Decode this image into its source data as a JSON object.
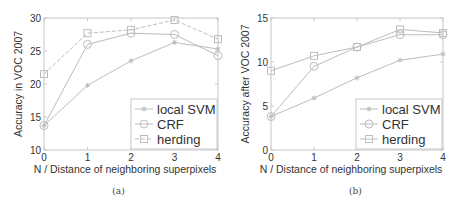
{
  "chart_data": [
    {
      "type": "line",
      "panel": "(a)",
      "title": "",
      "xlabel": "N / Distance of neighboring superpixels",
      "ylabel": "Accuracy in VOC 2007",
      "x": [
        0,
        1,
        2,
        3,
        4
      ],
      "xticks": [
        "0",
        "1",
        "2",
        "3",
        "4"
      ],
      "yticks": [
        "10",
        "15",
        "20",
        "25",
        "30"
      ],
      "xlim": [
        0,
        4
      ],
      "ylim": [
        10,
        30
      ],
      "grid": false,
      "legend_position": "lower right",
      "series": [
        {
          "name": "local SVM",
          "marker": "asterisk",
          "linestyle": "solid",
          "values": [
            13.7,
            19.8,
            23.5,
            26.3,
            25.3
          ]
        },
        {
          "name": "CRF",
          "marker": "circle",
          "linestyle": "solid",
          "values": [
            13.7,
            26.0,
            27.7,
            27.5,
            24.3
          ]
        },
        {
          "name": "herding",
          "marker": "square",
          "linestyle": "dashed",
          "values": [
            21.5,
            27.7,
            28.2,
            29.7,
            26.8
          ]
        }
      ],
      "caption": "(a)"
    },
    {
      "type": "line",
      "panel": "(b)",
      "title": "",
      "xlabel": "N / Distance of neighboring superpixels",
      "ylabel": "Accuracy after VOC 2007",
      "x": [
        0,
        1,
        2,
        3,
        4
      ],
      "xticks": [
        "0",
        "1",
        "2",
        "3",
        "4"
      ],
      "yticks": [
        "0",
        "5",
        "10",
        "15"
      ],
      "xlim": [
        0,
        4
      ],
      "ylim": [
        0,
        15
      ],
      "grid": false,
      "legend_position": "lower right",
      "series": [
        {
          "name": "local SVM",
          "marker": "asterisk",
          "linestyle": "solid",
          "values": [
            3.8,
            5.9,
            8.2,
            10.2,
            10.9
          ]
        },
        {
          "name": "CRF",
          "marker": "circle",
          "linestyle": "solid",
          "values": [
            3.8,
            9.5,
            11.7,
            13.1,
            13.1
          ]
        },
        {
          "name": "herding",
          "marker": "square",
          "linestyle": "solid",
          "values": [
            9.0,
            10.7,
            11.7,
            13.7,
            13.3
          ]
        }
      ],
      "caption": "(b)"
    }
  ],
  "colors": {
    "line": "#bdbdbd",
    "axis": "#c8c8c8",
    "text": "#333333"
  }
}
